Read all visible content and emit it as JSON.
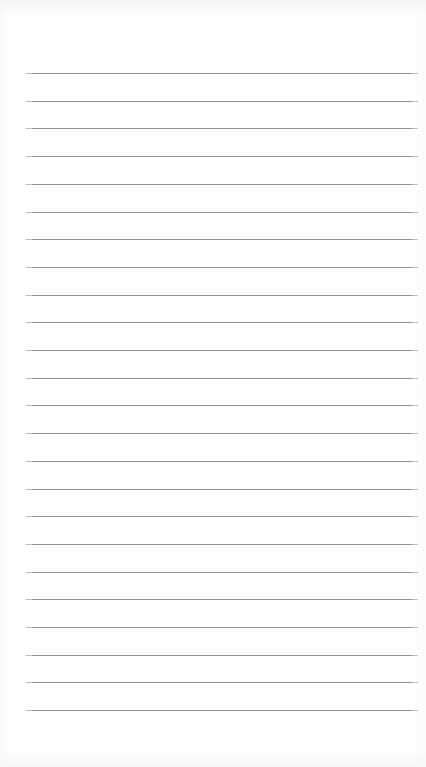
{
  "page": {
    "kind": "ruled-notepaper",
    "width": 426,
    "height": 767,
    "background_color": "#fefefe",
    "content_text": "",
    "header_text": "",
    "footer_text": "",
    "page_number": ""
  },
  "ruling": {
    "line_color": "#8d8d8f",
    "line_thickness_px": 1,
    "line_count": 24,
    "line_left_px": 31,
    "line_right_px": 413,
    "line_width_px": 382,
    "first_line_y_px": 73,
    "line_spacing_px": 27.7,
    "last_line_y_px": 711,
    "margin_rule_visible": false,
    "lines_y_px": [
      73,
      100.7,
      128.4,
      156.1,
      183.8,
      211.5,
      239.2,
      266.9,
      294.6,
      322.3,
      350,
      377.7,
      405.4,
      433.1,
      460.8,
      488.5,
      516.2,
      543.9,
      571.6,
      599.3,
      627,
      654.7,
      682.4,
      710.1
    ]
  }
}
